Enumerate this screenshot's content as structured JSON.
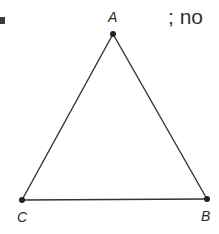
{
  "figure": {
    "type": "triangle",
    "vertices": [
      {
        "id": "A",
        "label": "A",
        "x": 113,
        "y": 34
      },
      {
        "id": "B",
        "label": "B",
        "x": 207,
        "y": 199
      },
      {
        "id": "C",
        "label": "C",
        "x": 22,
        "y": 200
      }
    ],
    "edges": [
      [
        "A",
        "B"
      ],
      [
        "B",
        "C"
      ],
      [
        "C",
        "A"
      ]
    ],
    "stroke_color": "#333333",
    "point_color": "#222222"
  },
  "labels": {
    "A": "A",
    "B": "B",
    "C": "C"
  },
  "fragment_text": "; no"
}
